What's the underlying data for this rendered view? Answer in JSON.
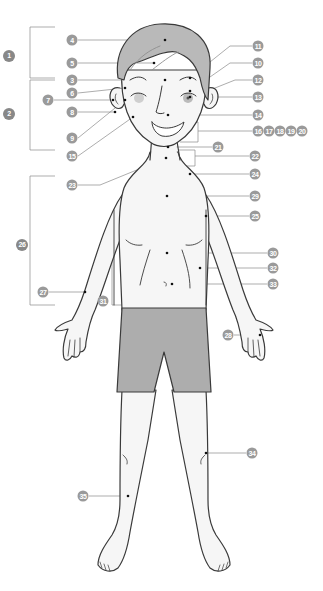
{
  "colors": {
    "hair": "#b9b9b9",
    "shorts": "#adadad",
    "skin": "#f6f6f6",
    "outline": "#3a3a3a",
    "badge": "#9a9a9a",
    "leader": "#8a8a8a",
    "cheek": "#cfcfcf"
  },
  "groups": [
    {
      "id": "1",
      "label": "1",
      "x": 9,
      "y": 56
    },
    {
      "id": "2",
      "label": "2",
      "x": 9,
      "y": 114
    },
    {
      "id": "26",
      "label": "26",
      "x": 22,
      "y": 245
    }
  ],
  "labels": [
    {
      "label": "4",
      "x": 72,
      "y": 40
    },
    {
      "label": "5",
      "x": 72,
      "y": 63
    },
    {
      "label": "3",
      "x": 72,
      "y": 80
    },
    {
      "label": "6",
      "x": 72,
      "y": 93
    },
    {
      "label": "7",
      "x": 48,
      "y": 100
    },
    {
      "label": "8",
      "x": 72,
      "y": 112
    },
    {
      "label": "9",
      "x": 72,
      "y": 138
    },
    {
      "label": "15",
      "x": 72,
      "y": 156
    },
    {
      "label": "23",
      "x": 72,
      "y": 185
    },
    {
      "label": "27",
      "x": 43,
      "y": 292
    },
    {
      "label": "31",
      "x": 103,
      "y": 301
    },
    {
      "label": "35",
      "x": 83,
      "y": 496
    },
    {
      "label": "11",
      "x": 258,
      "y": 46
    },
    {
      "label": "10",
      "x": 258,
      "y": 63
    },
    {
      "label": "12",
      "x": 258,
      "y": 80
    },
    {
      "label": "13",
      "x": 258,
      "y": 97
    },
    {
      "label": "14",
      "x": 258,
      "y": 115
    },
    {
      "label": "16",
      "x": 258,
      "y": 131
    },
    {
      "label": "17",
      "x": 269,
      "y": 131
    },
    {
      "label": "18",
      "x": 280,
      "y": 131
    },
    {
      "label": "19",
      "x": 291,
      "y": 131
    },
    {
      "label": "20",
      "x": 302,
      "y": 131
    },
    {
      "label": "21",
      "x": 218,
      "y": 147
    },
    {
      "label": "22",
      "x": 255,
      "y": 156
    },
    {
      "label": "24",
      "x": 255,
      "y": 174
    },
    {
      "label": "29",
      "x": 255,
      "y": 196
    },
    {
      "label": "25",
      "x": 255,
      "y": 216
    },
    {
      "label": "30",
      "x": 273,
      "y": 253
    },
    {
      "label": "32",
      "x": 273,
      "y": 268
    },
    {
      "label": "33",
      "x": 273,
      "y": 284
    },
    {
      "label": "28",
      "x": 228,
      "y": 335
    },
    {
      "label": "34",
      "x": 252,
      "y": 453
    }
  ]
}
